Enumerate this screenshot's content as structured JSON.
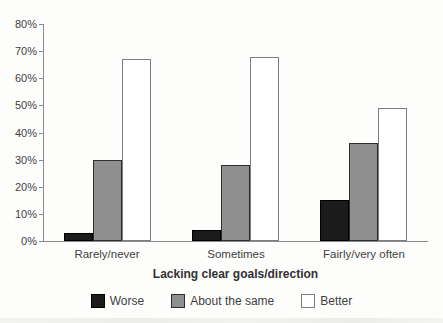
{
  "chart_data": {
    "type": "bar",
    "categories": [
      "Rarely/never",
      "Sometimes",
      "Fairly/very often"
    ],
    "series": [
      {
        "name": "Worse",
        "values": [
          3,
          4,
          15
        ],
        "fill": "#1b1b1b",
        "border": "#000000"
      },
      {
        "name": "About the same",
        "values": [
          30,
          28,
          36
        ],
        "fill": "#8f8f8f",
        "border": "#2e2e2e"
      },
      {
        "name": "Better",
        "values": [
          67,
          68,
          49
        ],
        "fill": "#ffffff",
        "border": "#7d7d7d"
      }
    ],
    "title": "",
    "xlabel": "Lacking clear goals/direction",
    "ylabel": "",
    "ylim": [
      0,
      80
    ],
    "ytick_step": 10,
    "ytick_labels": [
      "0%",
      "10%",
      "20%",
      "30%",
      "40%",
      "50%",
      "60%",
      "70%",
      "80%"
    ],
    "grid": false,
    "legend_position": "bottom",
    "legend_labels": [
      "Worse",
      "About the same",
      "Better"
    ]
  }
}
